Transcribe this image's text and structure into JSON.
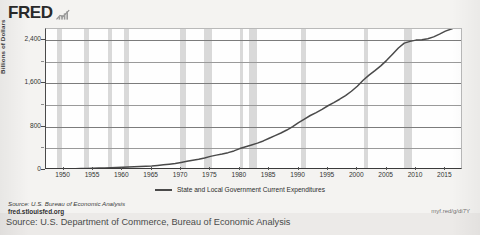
{
  "header": {
    "logo_text": "FRED",
    "logo_icon": "chart-glyph-icon"
  },
  "footer": {
    "source_note": "Source: U.S. Bureau of Economic Analysis",
    "fred_url": "fred.stlouisfed.org",
    "short_url": "myf.red/g/di7Y",
    "caption": "Source: U.S. Department of Commerce, Bureau of Economic Analysis"
  },
  "chart_data": {
    "type": "line",
    "title": "",
    "xlabel": "",
    "ylabel": "Billions of Dollars",
    "legend": [
      "State and Local Government Current Expenditures"
    ],
    "legend_position": "bottom-center",
    "grid": true,
    "xlim": [
      1947,
      2018
    ],
    "ylim": [
      0,
      2600
    ],
    "ytick_labels": [
      "0",
      "800",
      "1,600",
      "2,400"
    ],
    "ytick_values": [
      0,
      800,
      1600,
      2400
    ],
    "ygrid_minor_values": [
      400,
      1200,
      2000
    ],
    "xtick_labels": [
      "1950",
      "1955",
      "1960",
      "1965",
      "1970",
      "1975",
      "1980",
      "1985",
      "1990",
      "1995",
      "2000",
      "2005",
      "2010",
      "2015"
    ],
    "xtick_values": [
      1950,
      1955,
      1960,
      1965,
      1970,
      1975,
      1980,
      1985,
      1990,
      1995,
      2000,
      2005,
      2010,
      2015
    ],
    "series": [
      {
        "name": "State and Local Government Current Expenditures",
        "color": "#4a4a4a",
        "x": [
          1947,
          1948,
          1949,
          1950,
          1951,
          1952,
          1953,
          1954,
          1955,
          1956,
          1957,
          1958,
          1959,
          1960,
          1961,
          1962,
          1963,
          1964,
          1965,
          1966,
          1967,
          1968,
          1969,
          1970,
          1971,
          1972,
          1973,
          1974,
          1975,
          1976,
          1977,
          1978,
          1979,
          1980,
          1981,
          1982,
          1983,
          1984,
          1985,
          1986,
          1987,
          1988,
          1989,
          1990,
          1991,
          1992,
          1993,
          1994,
          1995,
          1996,
          1997,
          1998,
          1999,
          2000,
          2001,
          2002,
          2003,
          2004,
          2005,
          2006,
          2007,
          2008,
          2009,
          2010,
          2011,
          2012,
          2013,
          2014,
          2015,
          2016,
          2017
        ],
        "y": [
          15,
          17,
          19,
          21,
          23,
          25,
          27,
          29,
          32,
          35,
          39,
          43,
          46,
          50,
          55,
          59,
          64,
          70,
          76,
          85,
          96,
          108,
          121,
          140,
          160,
          179,
          198,
          222,
          251,
          274,
          295,
          320,
          352,
          395,
          430,
          462,
          496,
          536,
          585,
          634,
          683,
          737,
          800,
          875,
          940,
          1005,
          1058,
          1118,
          1185,
          1243,
          1305,
          1372,
          1452,
          1545,
          1655,
          1750,
          1832,
          1920,
          2022,
          2135,
          2250,
          2340,
          2372,
          2395,
          2400,
          2420,
          2455,
          2505,
          2560,
          2600,
          2640
        ],
        "units": "Billions of Dollars"
      }
    ],
    "recession_bands": [
      {
        "start": 1948.9,
        "end": 1949.8
      },
      {
        "start": 1953.5,
        "end": 1954.4
      },
      {
        "start": 1957.6,
        "end": 1958.3
      },
      {
        "start": 1960.3,
        "end": 1961.1
      },
      {
        "start": 1969.9,
        "end": 1970.9
      },
      {
        "start": 1973.9,
        "end": 1975.2
      },
      {
        "start": 1980.1,
        "end": 1980.5
      },
      {
        "start": 1981.5,
        "end": 1982.9
      },
      {
        "start": 1990.5,
        "end": 1991.2
      },
      {
        "start": 2001.2,
        "end": 2001.9
      },
      {
        "start": 2007.9,
        "end": 2009.4
      }
    ],
    "recession_color": "#d6d6d6",
    "plot_background": "#fefefe"
  }
}
